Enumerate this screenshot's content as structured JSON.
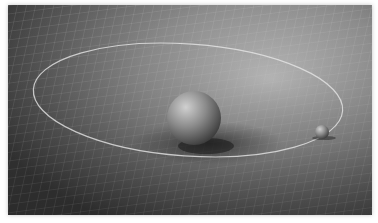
{
  "image": {
    "subject": "spacetime-curvature-illustration",
    "description": "Grid surface warped by a large sphere with a small sphere orbiting along an elliptical path",
    "colors": {
      "background": "#ffffff",
      "grid_dark": "#3e3e3e",
      "grid_light": "#b8b8b8",
      "grid_line": "#d8d8d8",
      "orbit": "#e6e6e6",
      "sphere": "#8a8a8a"
    },
    "large_sphere": {
      "cx": 186,
      "cy": 113,
      "r": 27
    },
    "small_sphere": {
      "cx": 314,
      "cy": 127,
      "r": 7
    },
    "orbit": {
      "cx": 180,
      "cy": 95,
      "rx": 155,
      "ry": 56
    }
  }
}
